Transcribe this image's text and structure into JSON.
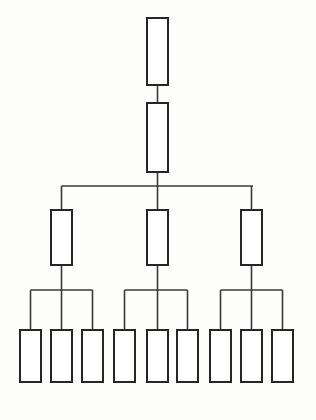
{
  "diagram": {
    "kind": "hierarchy-tree-diagram",
    "title": "",
    "canvas": {
      "width": 316,
      "height": 420
    },
    "background_color": "#fdfdfc",
    "box_fill_color": "#ffffff",
    "box_stroke_color": "#262626",
    "box_stroke_width": 2,
    "connector_color": "#3a3a3a",
    "connector_width": 1.6,
    "level_count": 4,
    "node_counts_per_level": [
      1,
      1,
      3,
      9
    ],
    "nodes": [
      {
        "id": "n0",
        "level": 0,
        "label": "",
        "x": 147,
        "y": 18,
        "w": 21,
        "h": 67
      },
      {
        "id": "n1",
        "level": 1,
        "label": "",
        "x": 147,
        "y": 103,
        "w": 21,
        "h": 69
      },
      {
        "id": "n2a",
        "level": 2,
        "label": "",
        "x": 51,
        "y": 210,
        "w": 21,
        "h": 55
      },
      {
        "id": "n2b",
        "level": 2,
        "label": "",
        "x": 147,
        "y": 210,
        "w": 21,
        "h": 55
      },
      {
        "id": "n2c",
        "level": 2,
        "label": "",
        "x": 241,
        "y": 210,
        "w": 21,
        "h": 55
      },
      {
        "id": "n3a1",
        "level": 3,
        "label": "",
        "x": 20,
        "y": 330,
        "w": 21,
        "h": 52
      },
      {
        "id": "n3a2",
        "level": 3,
        "label": "",
        "x": 51,
        "y": 330,
        "w": 21,
        "h": 52
      },
      {
        "id": "n3a3",
        "level": 3,
        "label": "",
        "x": 82,
        "y": 330,
        "w": 21,
        "h": 52
      },
      {
        "id": "n3b1",
        "level": 3,
        "label": "",
        "x": 114,
        "y": 330,
        "w": 21,
        "h": 52
      },
      {
        "id": "n3b2",
        "level": 3,
        "label": "",
        "x": 147,
        "y": 330,
        "w": 21,
        "h": 52
      },
      {
        "id": "n3b3",
        "level": 3,
        "label": "",
        "x": 177,
        "y": 330,
        "w": 21,
        "h": 52
      },
      {
        "id": "n3c1",
        "level": 3,
        "label": "",
        "x": 210,
        "y": 330,
        "w": 21,
        "h": 52
      },
      {
        "id": "n3c2",
        "level": 3,
        "label": "",
        "x": 241,
        "y": 330,
        "w": 21,
        "h": 52
      },
      {
        "id": "n3c3",
        "level": 3,
        "label": "",
        "x": 272,
        "y": 330,
        "w": 21,
        "h": 52
      }
    ],
    "connectors": [
      {
        "id": "c-root-stem",
        "from": "n0",
        "to": "n1",
        "points": "157.5,85 157.5,103"
      },
      {
        "id": "c-n1-down-stem",
        "from": "n1",
        "to": "bus-level2",
        "points": "157.5,172 157.5,186"
      },
      {
        "id": "c-bus-level2",
        "from": "bus-level2",
        "to": "bus-level2",
        "points": "61.5,186 253,186"
      },
      {
        "id": "c-bus-level2-drop-a",
        "from": "bus-level2",
        "to": "n2a",
        "points": "61.5,186 61.5,210"
      },
      {
        "id": "c-bus-level2-drop-b",
        "from": "bus-level2",
        "to": "n2b",
        "points": "157.5,186 157.5,210"
      },
      {
        "id": "c-bus-level2-drop-c",
        "from": "bus-level2",
        "to": "n2c",
        "points": "251.5,186 251.5,210"
      },
      {
        "id": "c-n2a-stem",
        "from": "n2a",
        "to": "bus-a",
        "points": "61.5,265 61.5,290"
      },
      {
        "id": "c-bus-a",
        "from": "bus-a",
        "to": "bus-a",
        "points": "30.5,290 92.5,290"
      },
      {
        "id": "c-bus-a-drop-1",
        "from": "bus-a",
        "to": "n3a1",
        "points": "30.5,290 30.5,330"
      },
      {
        "id": "c-bus-a-drop-2",
        "from": "bus-a",
        "to": "n3a2",
        "points": "61.5,290 61.5,330"
      },
      {
        "id": "c-bus-a-drop-3",
        "from": "bus-a",
        "to": "n3a3",
        "points": "92.5,290 92.5,330"
      },
      {
        "id": "c-n2b-stem",
        "from": "n2b",
        "to": "bus-b",
        "points": "157.5,265 157.5,290"
      },
      {
        "id": "c-bus-b",
        "from": "bus-b",
        "to": "bus-b",
        "points": "124.5,290 187.5,290"
      },
      {
        "id": "c-bus-b-drop-1",
        "from": "bus-b",
        "to": "n3b1",
        "points": "124.5,290 124.5,330"
      },
      {
        "id": "c-bus-b-drop-2",
        "from": "bus-b",
        "to": "n3b2",
        "points": "157.5,290 157.5,330"
      },
      {
        "id": "c-bus-b-drop-3",
        "from": "bus-b",
        "to": "n3b3",
        "points": "187.5,290 187.5,330"
      },
      {
        "id": "c-n2c-stem",
        "from": "n2c",
        "to": "bus-c",
        "points": "251.5,265 251.5,290"
      },
      {
        "id": "c-bus-c",
        "from": "bus-c",
        "to": "bus-c",
        "points": "220.5,290 282.5,290"
      },
      {
        "id": "c-bus-c-drop-1",
        "from": "bus-c",
        "to": "n3c1",
        "points": "220.5,290 220.5,330"
      },
      {
        "id": "c-bus-c-drop-2",
        "from": "bus-c",
        "to": "n3c2",
        "points": "251.5,290 251.5,330"
      },
      {
        "id": "c-bus-c-drop-3",
        "from": "bus-c",
        "to": "n3c3",
        "points": "282.5,290 282.5,330"
      }
    ]
  }
}
